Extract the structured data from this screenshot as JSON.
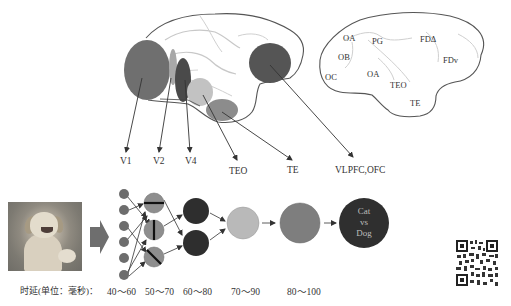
{
  "diagram": {
    "brain_left": {
      "regions": [
        {
          "id": "V1",
          "label": "V1",
          "color": "#6f6f6f"
        },
        {
          "id": "V2",
          "label": "V2",
          "color": "#a8a8a8"
        },
        {
          "id": "V4",
          "label": "V4",
          "color": "#4a4a4a"
        },
        {
          "id": "TEO",
          "label": "TEO",
          "color": "#c2c2c2"
        },
        {
          "id": "TE",
          "label": "TE",
          "color": "#8c8c8c"
        },
        {
          "id": "VLPFC_OFC",
          "label": "VLPFC,OFC",
          "color": "#555555"
        }
      ]
    },
    "brain_right": {
      "labels": [
        "OA",
        "PG",
        "FDΔ",
        "OB",
        "FDv",
        "OC",
        "OA",
        "TEO",
        "TE"
      ]
    },
    "network": {
      "input_image": "dog photo",
      "layers": [
        {
          "latency": "40～60",
          "nodes": 6,
          "color": "#6d6d6d"
        },
        {
          "latency": "50～70",
          "nodes": 3,
          "color": "#8e8e8e",
          "feature": "oriented edges"
        },
        {
          "latency": "60～80",
          "nodes": 2,
          "color": "#2e2e2e"
        },
        {
          "latency": "70～90",
          "nodes": 1,
          "color": "#b9b9b9"
        },
        {
          "latency": "80～100",
          "nodes": 1,
          "color": "#7e7e7e"
        }
      ],
      "output": {
        "line1": "Cat",
        "line2": "vs",
        "line3": "Dog",
        "color": "#2f2f2f"
      },
      "latency_caption": "时延(单位：毫秒)："
    }
  }
}
